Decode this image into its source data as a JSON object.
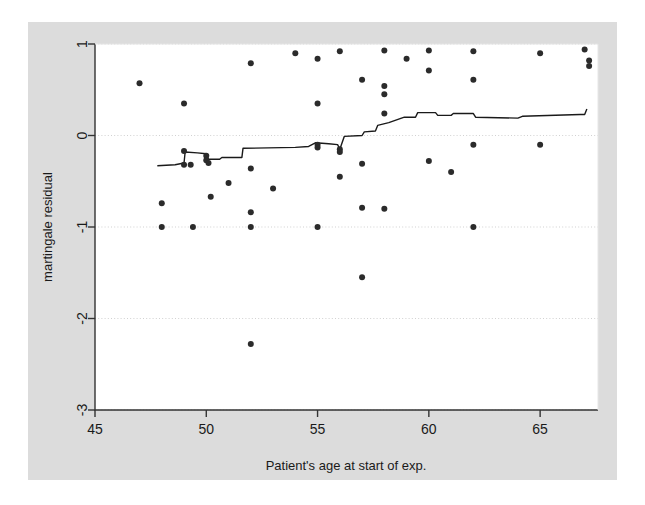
{
  "chart_data": {
    "type": "scatter",
    "title": "",
    "subtitle": "",
    "xlabel": "Patient's age at start of exp.",
    "ylabel": "martingale residual",
    "xlim": [
      45,
      67.6
    ],
    "ylim": [
      -3,
      1
    ],
    "xticks": [
      45,
      50,
      55,
      60,
      65
    ],
    "xticklabels": [
      "45",
      "50",
      "55",
      "60",
      "65"
    ],
    "yticks": [
      1,
      0,
      -1,
      -2,
      -3
    ],
    "yticklabels": [
      "1",
      "0",
      "-1",
      "-2",
      "-3"
    ],
    "grid": "horizontal-dotted-at-yticks",
    "legend": "none",
    "marker": "filled-circle",
    "marker_color": "#2b2b2b",
    "marker_size_px": 5,
    "line_color": "#1a1a1a",
    "line_width_px": 1.4,
    "background_color": "#dcdcdc",
    "plot_background_color": "#ffffff",
    "grid_color": "#cccccc",
    "axis_color": "#333333",
    "series": [
      {
        "name": "martingale residuals",
        "type": "scatter",
        "points": [
          [
            47.0,
            0.57
          ],
          [
            48.0,
            -0.74
          ],
          [
            48.0,
            -1.0
          ],
          [
            49.0,
            0.35
          ],
          [
            49.0,
            -0.17
          ],
          [
            49.0,
            -0.32
          ],
          [
            49.3,
            -0.32
          ],
          [
            49.4,
            -1.0
          ],
          [
            50.0,
            -0.22
          ],
          [
            50.0,
            -0.27
          ],
          [
            50.1,
            -0.3
          ],
          [
            50.2,
            -0.67
          ],
          [
            51.0,
            -0.52
          ],
          [
            52.0,
            0.79
          ],
          [
            52.0,
            -0.36
          ],
          [
            52.0,
            -0.84
          ],
          [
            52.0,
            -1.0
          ],
          [
            52.0,
            -2.28
          ],
          [
            53.0,
            -0.58
          ],
          [
            54.0,
            0.9
          ],
          [
            55.0,
            0.84
          ],
          [
            55.0,
            0.35
          ],
          [
            55.0,
            -0.1
          ],
          [
            55.0,
            -0.13
          ],
          [
            55.0,
            -1.0
          ],
          [
            56.0,
            0.92
          ],
          [
            56.0,
            -0.15
          ],
          [
            56.0,
            -0.18
          ],
          [
            56.0,
            -0.45
          ],
          [
            57.0,
            0.61
          ],
          [
            57.0,
            -0.31
          ],
          [
            57.0,
            -0.79
          ],
          [
            57.0,
            -1.55
          ],
          [
            58.0,
            0.93
          ],
          [
            58.0,
            0.54
          ],
          [
            58.0,
            0.45
          ],
          [
            58.0,
            0.24
          ],
          [
            58.0,
            -0.8
          ],
          [
            59.0,
            0.84
          ],
          [
            60.0,
            0.93
          ],
          [
            60.0,
            0.71
          ],
          [
            60.0,
            -0.28
          ],
          [
            61.0,
            -0.4
          ],
          [
            62.0,
            0.92
          ],
          [
            62.0,
            0.61
          ],
          [
            62.0,
            -0.1
          ],
          [
            62.0,
            -1.0
          ],
          [
            65.0,
            0.9
          ],
          [
            65.0,
            -0.1
          ],
          [
            67.0,
            0.94
          ],
          [
            67.2,
            0.82
          ],
          [
            67.2,
            0.76
          ]
        ]
      },
      {
        "name": "lowess smooth",
        "type": "line",
        "points": [
          [
            47.8,
            -0.33
          ],
          [
            48.6,
            -0.32
          ],
          [
            49.0,
            -0.3
          ],
          [
            49.05,
            -0.18
          ],
          [
            49.6,
            -0.19
          ],
          [
            50.0,
            -0.2
          ],
          [
            50.1,
            -0.26
          ],
          [
            50.6,
            -0.26
          ],
          [
            50.7,
            -0.24
          ],
          [
            51.6,
            -0.24
          ],
          [
            51.65,
            -0.14
          ],
          [
            54.0,
            -0.13
          ],
          [
            54.6,
            -0.12
          ],
          [
            54.9,
            -0.08
          ],
          [
            55.5,
            -0.09
          ],
          [
            55.9,
            -0.1
          ],
          [
            56.0,
            -0.15
          ],
          [
            56.2,
            -0.01
          ],
          [
            57.0,
            0.0
          ],
          [
            57.1,
            0.04
          ],
          [
            57.6,
            0.05
          ],
          [
            57.7,
            0.11
          ],
          [
            58.2,
            0.14
          ],
          [
            58.9,
            0.2
          ],
          [
            59.4,
            0.2
          ],
          [
            59.5,
            0.25
          ],
          [
            60.3,
            0.25
          ],
          [
            60.4,
            0.22
          ],
          [
            61.0,
            0.22
          ],
          [
            61.1,
            0.24
          ],
          [
            62.0,
            0.24
          ],
          [
            62.1,
            0.2
          ],
          [
            64.0,
            0.19
          ],
          [
            64.2,
            0.21
          ],
          [
            66.8,
            0.23
          ],
          [
            67.0,
            0.23
          ],
          [
            67.1,
            0.29
          ]
        ]
      }
    ]
  }
}
